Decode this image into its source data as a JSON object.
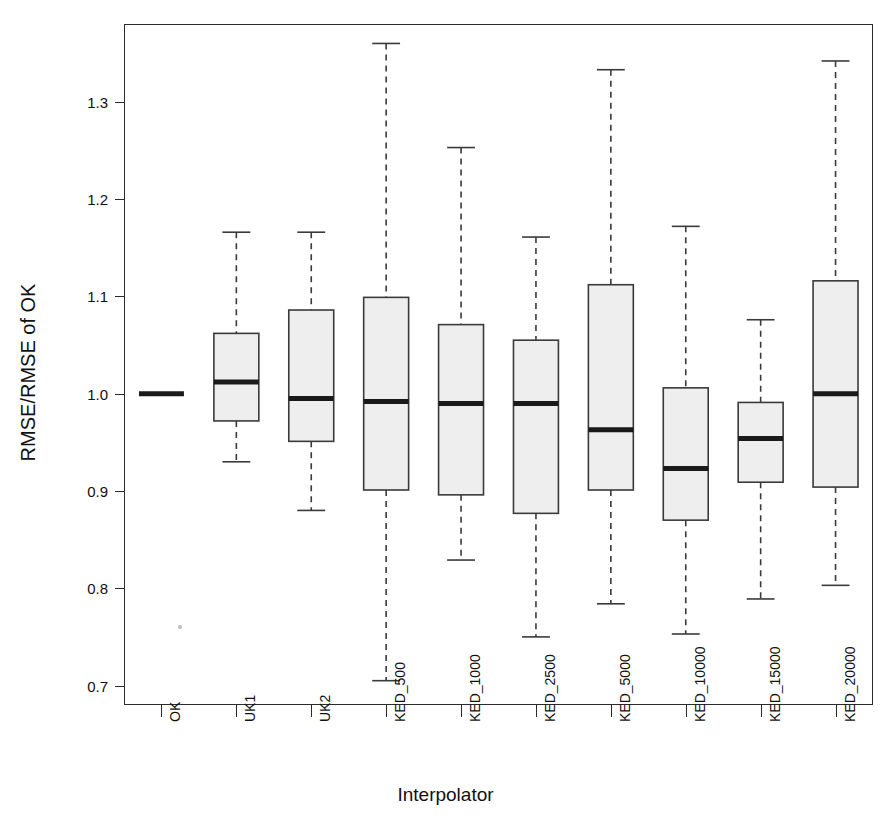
{
  "title": "",
  "axis": {
    "ylabel": "RMSE/RMSE of OK",
    "xlabel": "Interpolator",
    "yticks": [
      "0.7",
      "0.8",
      "0.9",
      "1.0",
      "1.1",
      "1.2",
      "1.3"
    ]
  },
  "chart_data": {
    "type": "box",
    "title": "",
    "xlabel": "Interpolator",
    "ylabel": "RMSE/RMSE of OK",
    "ylim": [
      0.68,
      1.38
    ],
    "ytick_values": [
      0.7,
      0.8,
      0.9,
      1.0,
      1.1,
      1.2,
      1.3
    ],
    "grid": false,
    "legend": "none",
    "categories": [
      "OK",
      "UK1",
      "UK2",
      "KED_500",
      "KED_1000",
      "KED_2500",
      "KED_5000",
      "KED_10000",
      "KED_15000",
      "KED_20000"
    ],
    "boxes": [
      {
        "label": "OK",
        "whisker_low": 1.0,
        "q1": 1.0,
        "median": 1.0,
        "q3": 1.0,
        "whisker_high": 1.0,
        "degenerate": true
      },
      {
        "label": "UK1",
        "whisker_low": 0.93,
        "q1": 0.972,
        "median": 1.012,
        "q3": 1.062,
        "whisker_high": 1.166,
        "degenerate": false
      },
      {
        "label": "UK2",
        "whisker_low": 0.88,
        "q1": 0.951,
        "median": 0.995,
        "q3": 1.086,
        "whisker_high": 1.166,
        "degenerate": false
      },
      {
        "label": "KED_500",
        "whisker_low": 0.705,
        "q1": 0.901,
        "median": 0.992,
        "q3": 1.099,
        "whisker_high": 1.36,
        "degenerate": false
      },
      {
        "label": "KED_1000",
        "whisker_low": 0.829,
        "q1": 0.896,
        "median": 0.99,
        "q3": 1.071,
        "whisker_high": 1.253,
        "degenerate": false
      },
      {
        "label": "KED_2500",
        "whisker_low": 0.75,
        "q1": 0.877,
        "median": 0.99,
        "q3": 1.055,
        "whisker_high": 1.161,
        "degenerate": false
      },
      {
        "label": "KED_5000",
        "whisker_low": 0.784,
        "q1": 0.901,
        "median": 0.963,
        "q3": 1.112,
        "whisker_high": 1.333,
        "degenerate": false
      },
      {
        "label": "KED_10000",
        "whisker_low": 0.753,
        "q1": 0.87,
        "median": 0.923,
        "q3": 1.006,
        "whisker_high": 1.172,
        "degenerate": false
      },
      {
        "label": "KED_15000",
        "whisker_low": 0.789,
        "q1": 0.909,
        "median": 0.954,
        "q3": 0.991,
        "whisker_high": 1.076,
        "degenerate": false
      },
      {
        "label": "KED_20000",
        "whisker_low": 0.803,
        "q1": 0.904,
        "median": 1.0,
        "q3": 1.116,
        "whisker_high": 1.342,
        "degenerate": false
      }
    ],
    "style": {
      "box_fill": "#eeeeee",
      "box_stroke": "#3a3a3a",
      "median_color": "#1a1a1a",
      "whisker_style": "dashed",
      "background": "#ffffff"
    }
  }
}
